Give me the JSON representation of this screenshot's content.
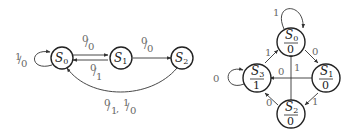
{
  "diagrams": [
    {
      "name": "mealy-machine",
      "states": [
        {
          "id": "S0",
          "label": "S",
          "sub": "0"
        },
        {
          "id": "S1",
          "label": "S",
          "sub": "1"
        },
        {
          "id": "S2",
          "label": "S",
          "sub": "2"
        }
      ],
      "transitions": [
        {
          "from": "S0",
          "to": "S0",
          "label": "1/0"
        },
        {
          "from": "S0",
          "to": "S1",
          "label": "0/0"
        },
        {
          "from": "S1",
          "to": "S0",
          "label": "0/1"
        },
        {
          "from": "S1",
          "to": "S2",
          "label": "0/0"
        },
        {
          "from": "S2",
          "to": "S0",
          "label": "0/1, 1/0"
        }
      ],
      "labels": {
        "s0_self_in": "1",
        "s0_self_out": "0",
        "s0_s1_in": "0",
        "s0_s1_out": "0",
        "s1_s0_in": "0",
        "s1_s0_out": "1",
        "s1_s2_in": "0",
        "s1_s2_out": "0",
        "s2_s0_a_in": "0",
        "s2_s0_a_out": "1",
        "s2_s0_b_in": "1",
        "s2_s0_b_out": "0"
      }
    },
    {
      "name": "moore-machine",
      "states": [
        {
          "id": "S0",
          "label": "S",
          "sub": "0",
          "output": "0"
        },
        {
          "id": "S1",
          "label": "S",
          "sub": "1",
          "output": "0"
        },
        {
          "id": "S2",
          "label": "S",
          "sub": "2",
          "output": "0"
        },
        {
          "id": "S3",
          "label": "S",
          "sub": "3",
          "output": "1"
        }
      ],
      "transitions": [
        {
          "from": "S0",
          "to": "S0",
          "label": "1"
        },
        {
          "from": "S0",
          "to": "S1",
          "label": "0"
        },
        {
          "from": "S1",
          "to": "S3",
          "label": "0"
        },
        {
          "from": "S1",
          "to": "S2",
          "label": "1"
        },
        {
          "from": "S2",
          "to": "S0",
          "label": "1"
        },
        {
          "from": "S2",
          "to": "S3",
          "label": "0"
        },
        {
          "from": "S3",
          "to": "S0",
          "label": "1"
        },
        {
          "from": "S3",
          "to": "S3",
          "label": "0"
        }
      ]
    }
  ]
}
